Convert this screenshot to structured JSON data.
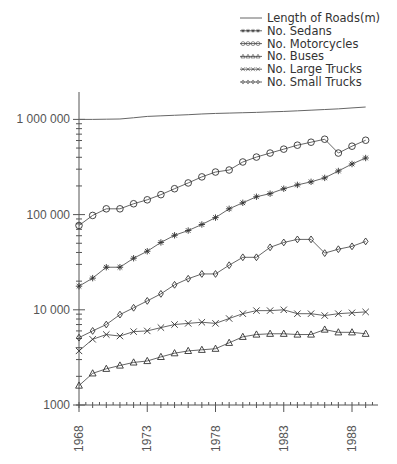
{
  "chart_data": {
    "type": "line",
    "title": "",
    "xlabel": "",
    "ylabel": "",
    "yscale": "log",
    "ylim": [
      1000,
      2000000
    ],
    "xlim": [
      1968,
      1989.5
    ],
    "grid": false,
    "legend_position": "top-right",
    "x": [
      1968,
      1969,
      1970,
      1971,
      1972,
      1973,
      1974,
      1975,
      1976,
      1977,
      1978,
      1979,
      1980,
      1981,
      1982,
      1983,
      1984,
      1985,
      1986,
      1987,
      1988,
      1989
    ],
    "x_ticks": [
      {
        "value": 1968,
        "label": "1968"
      },
      {
        "value": 1973,
        "label": "1973"
      },
      {
        "value": 1978,
        "label": "1978"
      },
      {
        "value": 1983,
        "label": "1983"
      },
      {
        "value": 1988,
        "label": "1988"
      }
    ],
    "y_ticks": [
      {
        "value": 1000,
        "label": "1000"
      },
      {
        "value": 10000,
        "label": "10 000"
      },
      {
        "value": 100000,
        "label": "100 000"
      },
      {
        "value": 1000000,
        "label": "1 000 000"
      }
    ],
    "series": [
      {
        "name": "Length of Roads(m)",
        "marker": "none",
        "values": [
          1000000,
          1000000,
          1005000,
          1010000,
          1040000,
          1075000,
          1090000,
          1105000,
          1120000,
          1140000,
          1155000,
          1165000,
          1175000,
          1185000,
          1200000,
          1212000,
          1230000,
          1250000,
          1270000,
          1290000,
          1320000,
          1349000
        ]
      },
      {
        "name": "No. Sedans",
        "marker": "star",
        "values": [
          17700,
          21500,
          28000,
          28000,
          34800,
          41200,
          51000,
          60600,
          68000,
          78700,
          93000,
          115000,
          133000,
          154000,
          166000,
          187000,
          205000,
          221000,
          243000,
          287000,
          340000,
          393000
        ]
      },
      {
        "name": "No. Motorcycles",
        "marker": "circle",
        "values": [
          76900,
          98000,
          115000,
          115000,
          130000,
          143000,
          162000,
          187000,
          215000,
          249000,
          280000,
          294000,
          357000,
          402000,
          443000,
          487000,
          536000,
          576000,
          619000,
          443000,
          523000,
          604000
        ]
      },
      {
        "name": "No. Buses",
        "marker": "triangle",
        "values": [
          1600,
          2150,
          2400,
          2600,
          2800,
          2900,
          3200,
          3500,
          3700,
          3800,
          3900,
          4500,
          5200,
          5500,
          5600,
          5600,
          5500,
          5500,
          6200,
          5800,
          5800,
          5600
        ]
      },
      {
        "name": "No. Large Trucks",
        "marker": "x",
        "values": [
          3700,
          4900,
          5500,
          5300,
          5900,
          6000,
          6500,
          7000,
          7200,
          7400,
          7200,
          8100,
          9100,
          9800,
          9800,
          10000,
          9100,
          9100,
          8700,
          9100,
          9300,
          9500
        ]
      },
      {
        "name": "No. Small Trucks",
        "marker": "diamond",
        "values": [
          5100,
          6000,
          7000,
          8900,
          10500,
          12400,
          14700,
          18300,
          21200,
          23800,
          23800,
          29400,
          35600,
          35600,
          45300,
          51000,
          54900,
          54900,
          39400,
          43300,
          46400,
          52300
        ]
      }
    ]
  }
}
